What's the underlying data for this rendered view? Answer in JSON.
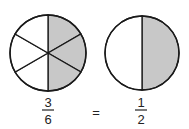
{
  "colors": {
    "shaded": "#c8c8c8",
    "stroke": "#1a1a1a",
    "background": "#ffffff"
  },
  "left_circle": {
    "parts": 6,
    "shaded_parts": 3,
    "shaded_side": "right"
  },
  "right_circle": {
    "parts": 2,
    "shaded_parts": 1,
    "shaded_side": "right"
  },
  "equation": {
    "left_fraction": {
      "numerator": "3",
      "denominator": "6"
    },
    "operator": "=",
    "right_fraction": {
      "numerator": "1",
      "denominator": "2"
    }
  }
}
